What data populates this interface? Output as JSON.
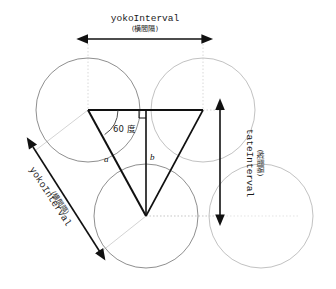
{
  "diagram": {
    "colors": {
      "background": "#ffffff",
      "circle_stroke": "#8c8c8c",
      "circle_stroke_faint": "#c6c6c6",
      "triangle_stroke": "#101010",
      "arrow_stroke": "#111111",
      "guide_stroke": "#bfbfbf",
      "guide_dotted": "#cccccc",
      "text": "#1a1a1a"
    },
    "labels": {
      "horizontal_top": {
        "name": "yokoInterval",
        "japanese": "(横間隔)"
      },
      "vertical_right": {
        "name": "tateInterval",
        "japanese": "(縦間隔)"
      },
      "diagonal_left": {
        "name": "yokoInterval",
        "japanese": "(横間隔)"
      },
      "angle": "60 度",
      "side_a": "a",
      "side_b": "b"
    },
    "geometry": {
      "circle_radius": 52,
      "circles": [
        {
          "id": "top-left",
          "cx": 88,
          "cy": 110
        },
        {
          "id": "top-right",
          "cx": 203,
          "cy": 110
        },
        {
          "id": "bottom-center",
          "cx": 146,
          "cy": 216
        },
        {
          "id": "bottom-right",
          "cx": 261,
          "cy": 216
        }
      ],
      "triangle": {
        "vertex_left": {
          "x": 88,
          "y": 110
        },
        "vertex_right": {
          "x": 203,
          "y": 110
        },
        "vertex_bottom": {
          "x": 146,
          "y": 216
        }
      },
      "median": {
        "x": 146,
        "y_top": 110,
        "y_bottom": 216
      },
      "horizontal_arrow": {
        "x1": 88,
        "x2": 203,
        "y": 39
      },
      "vertical_arrow": {
        "x": 220,
        "y1": 110,
        "y2": 216
      },
      "diagonal_arrow": {
        "x1": 33,
        "y1": 147,
        "x2": 100,
        "y2": 252
      }
    }
  }
}
